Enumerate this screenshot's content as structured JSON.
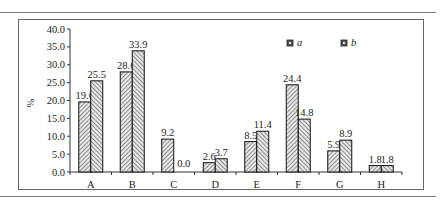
{
  "chart_data": {
    "type": "bar",
    "title": "",
    "xlabel": "",
    "ylabel": "%",
    "ylim": [
      0,
      40
    ],
    "yticks": [
      "0.0",
      "5.0",
      "10.0",
      "15.0",
      "20.0",
      "25.0",
      "30.0",
      "35.0",
      "40.0"
    ],
    "categories": [
      "A",
      "B",
      "C",
      "D",
      "E",
      "F",
      "G",
      "H"
    ],
    "series": [
      {
        "name": "a",
        "values": [
          19.6,
          28.0,
          9.2,
          2.6,
          8.5,
          24.4,
          5.9,
          1.8
        ],
        "labels": [
          "19.6",
          "28.0",
          "9.2",
          "2.6",
          "8.5",
          "24.4",
          "5.9",
          "1.8"
        ]
      },
      {
        "name": "b",
        "values": [
          25.5,
          33.9,
          0.0,
          3.7,
          11.4,
          14.8,
          8.9,
          1.8
        ],
        "labels": [
          "25.5",
          "33.9",
          "0.0",
          "3.7",
          "11.4",
          "14.8",
          "8.9",
          "1.8"
        ]
      }
    ],
    "legend_position": "top-right",
    "grid": false,
    "pattern": "diagonal-hatch"
  },
  "colors": {
    "bar_fill": "#d8d8d8",
    "hatch": "#555555",
    "outline": "#111111",
    "axis": "#333333"
  }
}
